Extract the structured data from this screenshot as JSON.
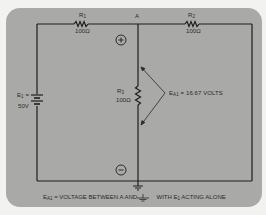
{
  "diagram": {
    "type": "circuit-schematic",
    "node_label": "A",
    "components": {
      "R1": {
        "name": "R",
        "sub": "1",
        "value": "100Ω"
      },
      "R2": {
        "name": "R",
        "sub": "2",
        "value": "100Ω"
      },
      "R3": {
        "name": "R",
        "sub": "3",
        "value": "100Ω"
      },
      "E1": {
        "name": "E",
        "sub": "1",
        "eq": " =",
        "value": "50V"
      }
    },
    "polarity": {
      "plus": "+",
      "minus": "−"
    },
    "measurement": {
      "name": "E",
      "sub": "A1",
      "text": " = 16.67 VOLTS"
    },
    "caption": {
      "name": "E",
      "sub": "A1",
      "part1": " = VOLTAGE BETWEEN A AND ",
      "part2": " WITH E",
      "part2_sub": "1",
      "part3": " ACTING ALONE"
    },
    "colors": {
      "panel": "#a9a9a7",
      "wire": "#1e1e1e",
      "background": "#f2f2f0"
    }
  }
}
